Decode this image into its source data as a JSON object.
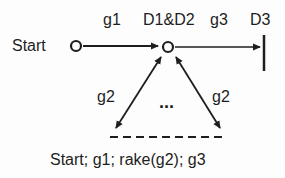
{
  "diagram": {
    "nodes": {
      "start": {
        "label": "Start"
      },
      "middle": {
        "label": "D1&D2"
      },
      "end": {
        "label": "D3"
      }
    },
    "edges": {
      "g1": {
        "label": "g1",
        "from": "Start",
        "to": "D1&D2"
      },
      "g3": {
        "label": "g3",
        "from": "D1&D2",
        "to": "D3"
      },
      "g2_left": {
        "label": "g2",
        "bidirectional": true
      },
      "g2_right": {
        "label": "g2",
        "bidirectional": true
      }
    },
    "ellipsis": "...",
    "caption": "Start; g1; rake(g2); g3",
    "colors": {
      "stroke": "#1e1e1e",
      "background": "#fdfdfd"
    }
  }
}
